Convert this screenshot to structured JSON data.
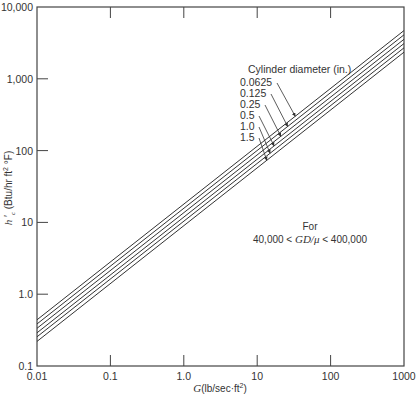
{
  "chart_data": {
    "type": "line",
    "title": "",
    "xlabel": "G(lb/sec·ft²)",
    "ylabel": "h'c (Btu/hr ft² °F)",
    "xscale": "log",
    "yscale": "log",
    "xlim": [
      0.01,
      1000
    ],
    "ylim": [
      0.1,
      10000
    ],
    "grid": false,
    "x_ticks": [
      "0.01",
      "0.1",
      "1.0",
      "10",
      "100",
      "1000"
    ],
    "y_ticks": [
      "0.1",
      "1.0",
      "10",
      "100",
      "1,000",
      "10,000"
    ],
    "legend": {
      "title": "Cylinder diameter (in.)",
      "position": "upper center, arrows to lines"
    },
    "annotation": {
      "line1": "For",
      "line2_left": "40,000 <",
      "line2_mid": "GD/μ",
      "line2_right": "< 400,000"
    },
    "series": [
      {
        "name": "0.0625",
        "x": [
          0.01,
          1000
        ],
        "y": [
          0.44,
          4700
        ]
      },
      {
        "name": "0.125",
        "x": [
          0.01,
          1000
        ],
        "y": [
          0.385,
          4100
        ]
      },
      {
        "name": "0.25",
        "x": [
          0.01,
          1000
        ],
        "y": [
          0.335,
          3550
        ]
      },
      {
        "name": "0.5",
        "x": [
          0.01,
          1000
        ],
        "y": [
          0.29,
          3100
        ]
      },
      {
        "name": "1.0",
        "x": [
          0.01,
          1000
        ],
        "y": [
          0.255,
          2700
        ]
      },
      {
        "name": "1.5",
        "x": [
          0.01,
          1000
        ],
        "y": [
          0.22,
          2350
        ]
      }
    ]
  }
}
